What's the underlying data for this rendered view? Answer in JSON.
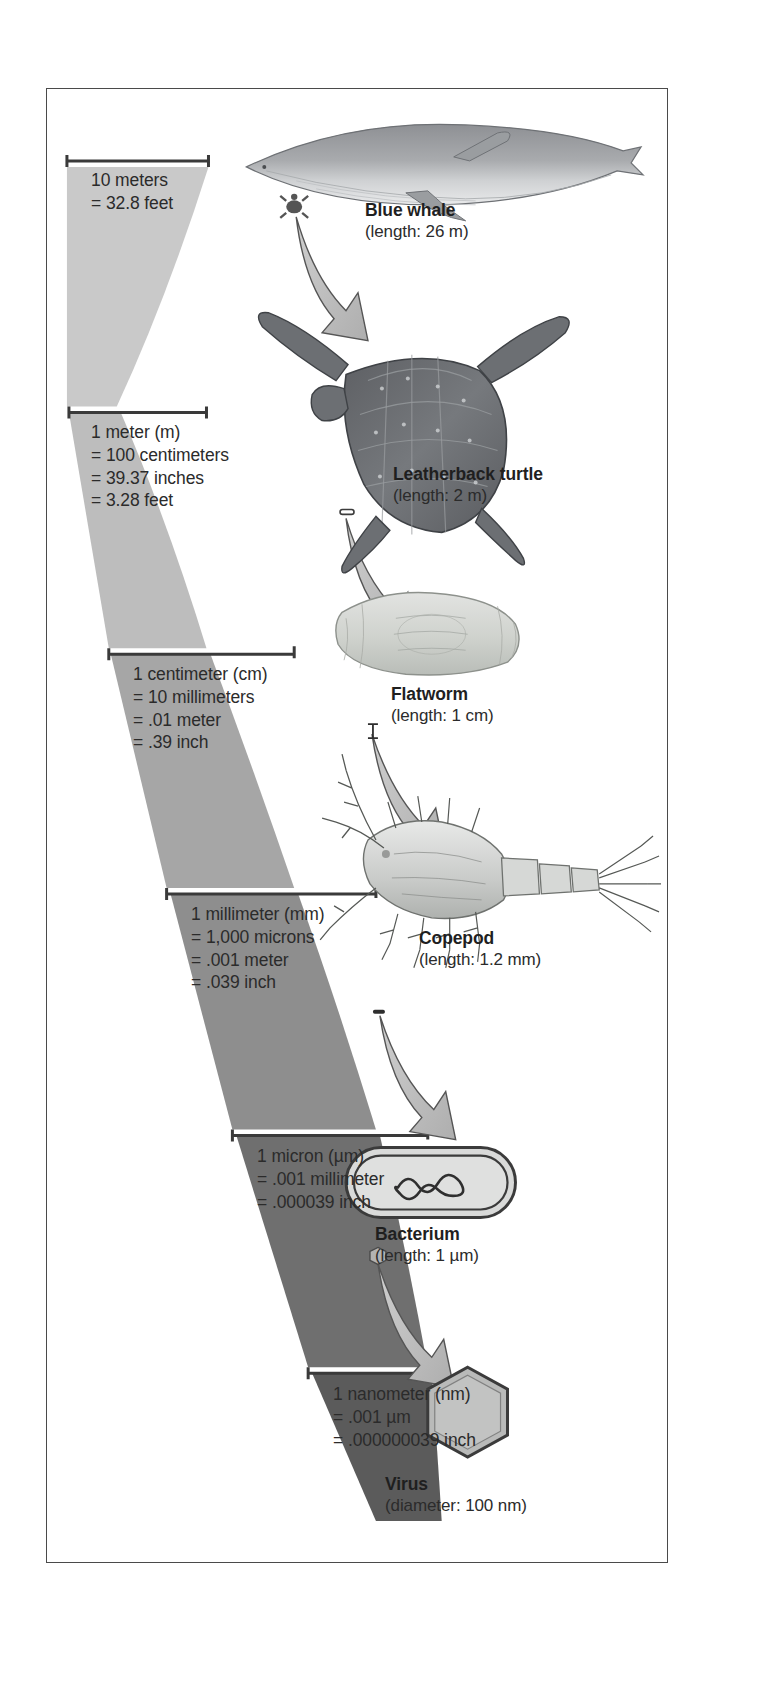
{
  "figure": {
    "background_color": "#ffffff",
    "frame_color": "#4a4a4a"
  },
  "scale_bars": [
    {
      "id": "ten-meters",
      "lines": [
        "10 meters",
        "= 32.8 feet"
      ],
      "wedge_color": "#c7c7c7"
    },
    {
      "id": "one-meter",
      "lines": [
        "1 meter (m)",
        "= 100 centimeters",
        "= 39.37 inches",
        "= 3.28 feet"
      ],
      "wedge_color": "#bdbdbd"
    },
    {
      "id": "one-centimeter",
      "lines": [
        "1 centimeter (cm)",
        "= 10 millimeters",
        "= .01 meter",
        "= .39 inch"
      ],
      "wedge_color": "#a8a8a8"
    },
    {
      "id": "one-millimeter",
      "lines": [
        "1 millimeter (mm)",
        "= 1,000 microns",
        "= .001 meter",
        "= .039 inch"
      ],
      "wedge_color": "#8f8f8f"
    },
    {
      "id": "one-micron",
      "lines": [
        "1 micron (µm)",
        "= .001 millimeter",
        "= .000039 inch"
      ],
      "wedge_color": "#6e6e6e"
    },
    {
      "id": "one-nanometer",
      "lines": [
        "1 nanometer (nm)",
        "= .001 µm",
        "= .000000039 inch"
      ],
      "wedge_color": "#5a5a5a"
    }
  ],
  "organisms": [
    {
      "id": "blue-whale",
      "name": "Blue whale",
      "size": "(length: 26 m)",
      "icon": "whale-illustration"
    },
    {
      "id": "leatherback-turtle",
      "name": "Leatherback turtle",
      "size": "(length: 2 m)",
      "icon": "turtle-illustration"
    },
    {
      "id": "flatworm",
      "name": "Flatworm",
      "size": "(length: 1 cm)",
      "icon": "flatworm-illustration"
    },
    {
      "id": "copepod",
      "name": "Copepod",
      "size": "(length: 1.2 mm)",
      "icon": "copepod-illustration"
    },
    {
      "id": "bacterium",
      "name": "Bacterium",
      "size": "(length: 1 µm)",
      "icon": "bacterium-illustration"
    },
    {
      "id": "virus",
      "name": "Virus",
      "size": "(diameter: 100 nm)",
      "icon": "virus-illustration"
    }
  ],
  "arrows": {
    "count": 5,
    "color": "#b8b8b8",
    "outline_color": "#4a4a4a",
    "description": "curved magnification arrows pointing from the smaller preview to the enlarged organism"
  }
}
